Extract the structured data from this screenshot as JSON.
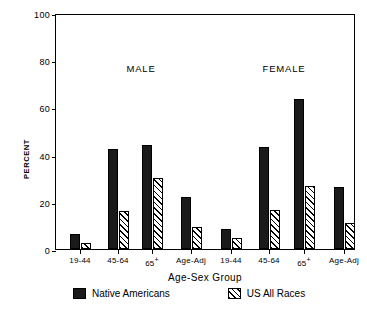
{
  "chart_data": {
    "type": "bar",
    "title": "",
    "xlabel": "Age-Sex Group",
    "ylabel": "PERCENT",
    "ylim": [
      0,
      100
    ],
    "yticks": [
      0,
      20,
      40,
      60,
      80,
      100
    ],
    "grid": false,
    "legend_position": "bottom",
    "group_labels": [
      "MALE",
      "FEMALE"
    ],
    "categories": [
      "19-44",
      "45-64",
      "65+",
      "Age-Adj",
      "19-44",
      "45-64",
      "65+",
      "Age-Adj"
    ],
    "series": [
      {
        "name": "Native Americans",
        "style": "solid",
        "color": "#1a1a1a",
        "values": [
          6.5,
          42.3,
          44.2,
          22.0,
          8.5,
          43.3,
          63.5,
          26.3
        ]
      },
      {
        "name": "US All Races",
        "style": "hatched",
        "color": "#ffffff",
        "values": [
          2.5,
          16.0,
          30.2,
          9.5,
          4.8,
          16.5,
          26.8,
          11.0
        ]
      }
    ]
  },
  "axis": {
    "y_title": "PERCENT",
    "x_title": "Age-Sex Group",
    "y_tick_labels": [
      "0",
      "20",
      "40",
      "60",
      "80",
      "100"
    ]
  },
  "annotations": {
    "male": "MALE",
    "female": "FEMALE"
  },
  "legend": {
    "items": [
      {
        "label": "Native Americans",
        "swatch": "solid-black-square"
      },
      {
        "label": "US All Races",
        "swatch": "hatched-square"
      }
    ]
  },
  "caption": ""
}
